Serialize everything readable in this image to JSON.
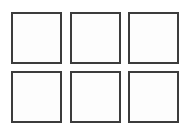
{
  "canvas": {
    "width": 190,
    "height": 131,
    "background_color": "#ffffff",
    "description": "Blank 3 by 2 grid of empty squares"
  },
  "style": {
    "border_color": "#3c3c3c",
    "border_width_px": 2,
    "cell_fill_color": "#fdfdfd",
    "cell_width_px": 51,
    "cell_height_px": 52,
    "column_gap_px": 8,
    "row_gap_px": 7
  },
  "grid": {
    "columns": 3,
    "rows": 2,
    "total_cells": 6,
    "rows_data": [
      {
        "row_index": 1,
        "cells": [
          {
            "id": "cell-r1c1",
            "row": 1,
            "column": 1,
            "label": ""
          },
          {
            "id": "cell-r1c2",
            "row": 1,
            "column": 2,
            "label": ""
          },
          {
            "id": "cell-r1c3",
            "row": 1,
            "column": 3,
            "label": ""
          }
        ]
      },
      {
        "row_index": 2,
        "cells": [
          {
            "id": "cell-r2c1",
            "row": 2,
            "column": 1,
            "label": ""
          },
          {
            "id": "cell-r2c2",
            "row": 2,
            "column": 2,
            "label": ""
          },
          {
            "id": "cell-r2c3",
            "row": 2,
            "column": 3,
            "label": ""
          }
        ]
      }
    ]
  }
}
